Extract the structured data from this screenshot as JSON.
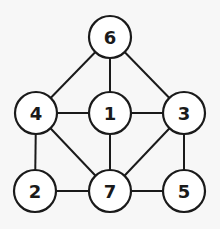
{
  "graph": {
    "background": "#f7f7f7",
    "stroke_color": "#1a1a1a",
    "node_fill": "#ffffff",
    "node_radius": 21,
    "nodes": [
      {
        "id": "6",
        "label": "6",
        "x": 110,
        "y": 37
      },
      {
        "id": "4",
        "label": "4",
        "x": 36,
        "y": 113
      },
      {
        "id": "1",
        "label": "1",
        "x": 110,
        "y": 113
      },
      {
        "id": "3",
        "label": "3",
        "x": 184,
        "y": 113
      },
      {
        "id": "2",
        "label": "2",
        "x": 35,
        "y": 191
      },
      {
        "id": "7",
        "label": "7",
        "x": 110,
        "y": 191
      },
      {
        "id": "5",
        "label": "5",
        "x": 184,
        "y": 191
      }
    ],
    "edges": [
      [
        "6",
        "4"
      ],
      [
        "6",
        "1"
      ],
      [
        "6",
        "3"
      ],
      [
        "4",
        "1"
      ],
      [
        "1",
        "3"
      ],
      [
        "4",
        "2"
      ],
      [
        "4",
        "7"
      ],
      [
        "1",
        "7"
      ],
      [
        "3",
        "7"
      ],
      [
        "3",
        "5"
      ],
      [
        "2",
        "7"
      ],
      [
        "7",
        "5"
      ]
    ]
  }
}
